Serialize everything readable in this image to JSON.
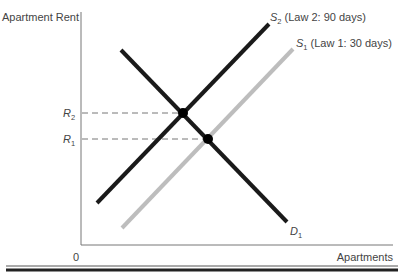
{
  "axes": {
    "y_label": "Apartment Rent",
    "x_label": "Apartments",
    "origin_label": "0"
  },
  "curves": [
    {
      "id": "S2",
      "letter": "S",
      "subscript": "2",
      "description": "(Law 2: 90 days)",
      "color": "#1a1a1a"
    },
    {
      "id": "S1",
      "letter": "S",
      "subscript": "1",
      "description": "(Law 1: 30 days)",
      "color": "#bdbdbd"
    },
    {
      "id": "D1",
      "letter": "D",
      "subscript": "1",
      "description": "",
      "color": "#1a1a1a"
    }
  ],
  "price_levels": [
    {
      "id": "R2",
      "letter": "R",
      "subscript": "2"
    },
    {
      "id": "R1",
      "letter": "R",
      "subscript": "1"
    }
  ],
  "colors": {
    "axis": "#777777",
    "dark_line": "#1a1a1a",
    "light_line": "#bdbdbd",
    "dashed": "#666666"
  }
}
